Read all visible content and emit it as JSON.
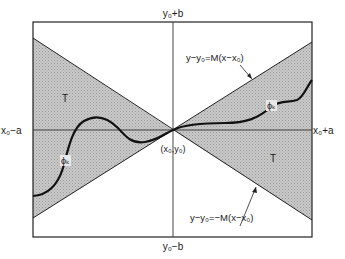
{
  "diagram": {
    "labels": {
      "top": "y₀+b",
      "bottom": "y₀−b",
      "left": "x₀−a",
      "right": "x₀+a",
      "center": "(x₀,y₀)",
      "region_left": "T",
      "region_right": "T",
      "curve_left": "ϕₖ",
      "curve_right": "ϕₖ",
      "upper_line_eq": "y−y₀=M(x−x₀)",
      "lower_line_eq": "y−y₀=−M(x−x₀)"
    },
    "colors": {
      "shade": "#c4c4c4",
      "line": "#222222",
      "background": "#ffffff"
    }
  }
}
